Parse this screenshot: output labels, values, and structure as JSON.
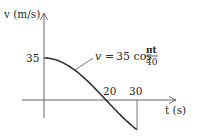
{
  "chart_data": {
    "type": "line",
    "title": "",
    "xlabel": "t (s)",
    "ylabel": "v (m/s)",
    "equation": {
      "lhs": "v",
      "eq": "=",
      "coef": "35 cos",
      "numerator": "πt",
      "denominator": "40"
    },
    "x_ticks": [
      {
        "value": 20,
        "label": "20"
      },
      {
        "value": 30,
        "label": "30"
      }
    ],
    "y_ticks": [
      {
        "value": 35,
        "label": "35"
      }
    ],
    "xlim": [
      -7,
      43
    ],
    "ylim": [
      -15,
      70
    ],
    "series": [
      {
        "name": "v = 35 cos(πt/40)",
        "x": [
          0,
          5,
          10,
          15,
          20,
          25,
          30
        ],
        "values": [
          35,
          32.34,
          24.75,
          13.39,
          0,
          -13.39,
          -24.75
        ]
      }
    ],
    "annotations": [
      {
        "text": "v = 35 cos πt/40",
        "points_to": {
          "x": 10,
          "y": 24.75
        }
      },
      {
        "type": "vertical-drop",
        "x": 30,
        "from": -24.75,
        "to": 0
      }
    ],
    "grid": false,
    "legend": "none",
    "colors": {
      "axis": "#555555",
      "curve": "#333333",
      "text": "#2a2a2a"
    }
  }
}
